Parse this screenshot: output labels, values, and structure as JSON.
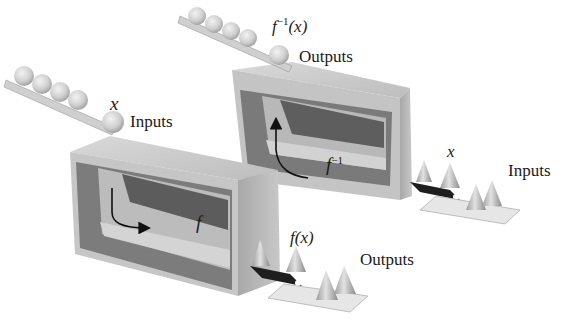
{
  "diagram": {
    "machines": [
      {
        "name": "f",
        "label": "f",
        "input_symbol": "x",
        "input_label": "Inputs",
        "output_symbol": "f(x)",
        "output_label": "Outputs",
        "input_items": "balls",
        "output_items": "cones"
      },
      {
        "name": "f-inverse",
        "label_base": "f",
        "label_sup": "−1",
        "input_symbol": "x",
        "input_label": "Inputs",
        "output_symbol_base": "f",
        "output_symbol_sup": "−1",
        "output_symbol_arg": "(x)",
        "output_label": "Outputs",
        "input_items": "cones",
        "output_items": "balls"
      }
    ],
    "colors": {
      "box_face": "#c9c9c9",
      "box_dark": "#6d6d6d",
      "conveyor": "#1e1e1e",
      "ball": "#d6d6d6",
      "text": "#1a1a1a"
    }
  }
}
